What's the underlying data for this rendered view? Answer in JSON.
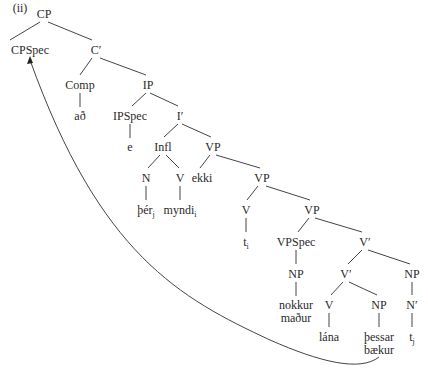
{
  "diagram": {
    "label": "(ii)",
    "nodes": [
      {
        "id": "cp",
        "text": "CP",
        "x": 44,
        "y": 8
      },
      {
        "id": "cpspec",
        "text": "CPSpec",
        "x": 30,
        "y": 44
      },
      {
        "id": "cbar",
        "text": "C′",
        "x": 96,
        "y": 44
      },
      {
        "id": "comp",
        "text": "Comp",
        "x": 80,
        "y": 79
      },
      {
        "id": "ad",
        "text": "að",
        "x": 80,
        "y": 110
      },
      {
        "id": "ip",
        "text": "IP",
        "x": 148,
        "y": 79
      },
      {
        "id": "ipspec",
        "text": "IPSpec",
        "x": 130,
        "y": 110
      },
      {
        "id": "e",
        "text": "e",
        "x": 130,
        "y": 141
      },
      {
        "id": "ibar",
        "text": "I′",
        "x": 180,
        "y": 110
      },
      {
        "id": "infl",
        "text": "Infl",
        "x": 163,
        "y": 141
      },
      {
        "id": "vp1",
        "text": "VP",
        "x": 213,
        "y": 141
      },
      {
        "id": "n1",
        "text": "N",
        "x": 146,
        "y": 172
      },
      {
        "id": "v1",
        "text": "V",
        "x": 180,
        "y": 172
      },
      {
        "id": "ekki",
        "text": "ekki",
        "x": 202,
        "y": 172
      },
      {
        "id": "ther",
        "text": "þér",
        "sub": "j",
        "x": 146,
        "y": 204
      },
      {
        "id": "myndi",
        "text": "myndi",
        "sub": "i",
        "x": 180,
        "y": 204
      },
      {
        "id": "vp2",
        "text": "VP",
        "x": 262,
        "y": 172
      },
      {
        "id": "v2",
        "text": "V",
        "x": 246,
        "y": 204
      },
      {
        "id": "ti",
        "text": "t",
        "sub": "i",
        "x": 246,
        "y": 236
      },
      {
        "id": "vp3",
        "text": "VP",
        "x": 312,
        "y": 204
      },
      {
        "id": "vpspec",
        "text": "VPSpec",
        "x": 296,
        "y": 236
      },
      {
        "id": "vbar1",
        "text": "V′",
        "x": 365,
        "y": 236
      },
      {
        "id": "np1",
        "text": "NP",
        "x": 296,
        "y": 268
      },
      {
        "id": "nokkur",
        "text": "nokkur",
        "x": 296,
        "y": 299
      },
      {
        "id": "madur",
        "text": "maður",
        "x": 296,
        "y": 312
      },
      {
        "id": "vbar2",
        "text": "V′",
        "x": 346,
        "y": 268
      },
      {
        "id": "np3",
        "text": "NP",
        "x": 412,
        "y": 268
      },
      {
        "id": "v3",
        "text": "V",
        "x": 329,
        "y": 299
      },
      {
        "id": "np2",
        "text": "NP",
        "x": 379,
        "y": 299
      },
      {
        "id": "nbar",
        "text": "N′",
        "x": 412,
        "y": 299
      },
      {
        "id": "lana",
        "text": "lána",
        "x": 329,
        "y": 331
      },
      {
        "id": "thessar",
        "text": "þessar",
        "x": 379,
        "y": 331
      },
      {
        "id": "baekur",
        "text": "bækur",
        "x": 379,
        "y": 344
      },
      {
        "id": "tj",
        "text": "t",
        "sub": "j",
        "x": 412,
        "y": 331
      }
    ],
    "arrow": {
      "from": "þessar bækur",
      "to": "CPSpec"
    }
  }
}
